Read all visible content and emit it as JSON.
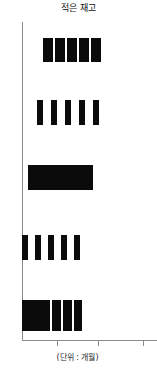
{
  "chart": {
    "title": "적은 재고",
    "xlabel": "(단위 : 개월)"
  },
  "chart_data": {
    "type": "bar",
    "title": "적은 재고",
    "subtitle": "",
    "xlabel": "(단위 : 개월)",
    "ylabel": "",
    "orientation": "horizontal",
    "grid": false,
    "legend": null,
    "axis": {
      "y_axis_x_px": 22,
      "x_axis_y_px": 340,
      "x_tick_positions_px": [
        57,
        98,
        143
      ],
      "x_tick_labels": [
        "",
        "",
        ""
      ],
      "x_tick_spacing_px": 43,
      "xlim_px": [
        22,
        157
      ]
    },
    "colors": {
      "bar": "#0b0b0b",
      "axis": "#8a8a8a",
      "background": "#ffffff",
      "text": "#111111"
    },
    "categories": [
      "row-1",
      "row-2",
      "row-3",
      "row-4",
      "row-5"
    ],
    "rows": [
      {
        "name": "row-1",
        "top": 38,
        "height": 24,
        "segment_count": 5,
        "start_px": 43,
        "end_px": 101,
        "segments": [
          {
            "x": 43,
            "w": 10
          },
          {
            "x": 55,
            "w": 10
          },
          {
            "x": 67,
            "w": 10
          },
          {
            "x": 79,
            "w": 10
          },
          {
            "x": 91,
            "w": 10
          }
        ]
      },
      {
        "name": "row-2",
        "top": 100,
        "height": 25,
        "segment_count": 5,
        "start_px": 37,
        "end_px": 99,
        "segments": [
          {
            "x": 37,
            "w": 6
          },
          {
            "x": 51,
            "w": 6
          },
          {
            "x": 65,
            "w": 6
          },
          {
            "x": 79,
            "w": 6
          },
          {
            "x": 93,
            "w": 6
          }
        ]
      },
      {
        "name": "row-3",
        "top": 165,
        "height": 25,
        "segment_count": 1,
        "start_px": 28,
        "end_px": 93,
        "segments": [
          {
            "x": 28,
            "w": 65
          }
        ]
      },
      {
        "name": "row-4",
        "top": 235,
        "height": 25,
        "segment_count": 5,
        "start_px": 22,
        "end_px": 82,
        "segments": [
          {
            "x": 22,
            "w": 6
          },
          {
            "x": 35,
            "w": 6
          },
          {
            "x": 48,
            "w": 6
          },
          {
            "x": 61,
            "w": 6
          },
          {
            "x": 74,
            "w": 6
          }
        ]
      },
      {
        "name": "row-5",
        "top": 300,
        "height": 31,
        "segment_count": 4,
        "start_px": 22,
        "end_px": 82,
        "segments": [
          {
            "x": 22,
            "w": 28
          },
          {
            "x": 52,
            "w": 9
          },
          {
            "x": 63,
            "w": 9
          },
          {
            "x": 74,
            "w": 8
          }
        ]
      }
    ]
  }
}
